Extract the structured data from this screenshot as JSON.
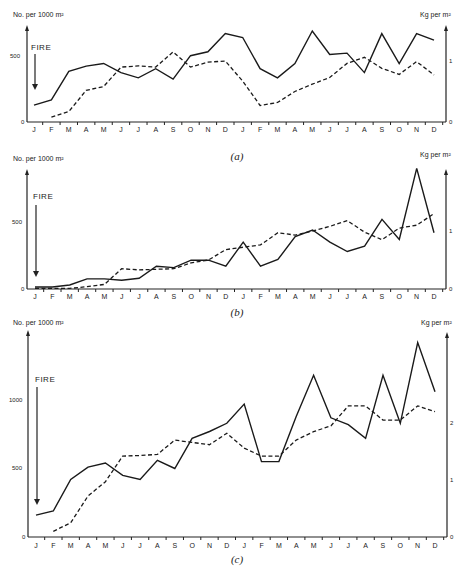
{
  "chart_data": [
    {
      "type": "line",
      "caption": "(a)",
      "title": "",
      "annotation": "FIRE",
      "ylabel_left": "No. per 1000 m²",
      "ylabel_right": "Kg per m²",
      "x": [
        "J",
        "F",
        "M",
        "A",
        "M",
        "J",
        "J",
        "A",
        "S",
        "O",
        "N",
        "D",
        "J",
        "F",
        "M",
        "A",
        "M",
        "J",
        "J",
        "A",
        "S",
        "O",
        "N",
        "D"
      ],
      "left_ticks": [
        "0",
        "500"
      ],
      "right_ticks": [
        "0",
        "1"
      ],
      "ylim_left": [
        0,
        800
      ],
      "ylim_right": [
        0,
        1.3
      ],
      "series": [
        {
          "name": "No. per 1000 m² (solid)",
          "axis": "left",
          "style": "solid",
          "values": [
            130,
            170,
            390,
            430,
            450,
            380,
            340,
            410,
            330,
            510,
            540,
            680,
            650,
            410,
            340,
            450,
            700,
            520,
            530,
            380,
            680,
            450,
            680,
            630
          ]
        },
        {
          "name": "Kg per m² (dashed)",
          "axis": "right",
          "style": "dashed",
          "values": [
            null,
            0.08,
            0.17,
            0.52,
            0.58,
            0.9,
            0.92,
            0.9,
            1.15,
            0.9,
            0.98,
            1.0,
            0.67,
            0.27,
            0.32,
            0.5,
            0.62,
            0.73,
            0.96,
            1.06,
            0.88,
            0.78,
            0.99,
            0.77
          ]
        }
      ]
    },
    {
      "type": "line",
      "caption": "(b)",
      "title": "",
      "annotation": "FIRE",
      "ylabel_left": "No. per 1000 m²",
      "ylabel_right": "Kg per m²",
      "x": [
        "J",
        "F",
        "M",
        "A",
        "M",
        "J",
        "J",
        "A",
        "S",
        "O",
        "N",
        "D",
        "J",
        "F",
        "M",
        "A",
        "M",
        "J",
        "J",
        "A",
        "S",
        "O",
        "N",
        "D"
      ],
      "left_ticks": [
        "0",
        "500"
      ],
      "right_ticks": [
        "0",
        "1"
      ],
      "ylim_left": [
        0,
        900
      ],
      "ylim_right": [
        0,
        1.6
      ],
      "series": [
        {
          "name": "No. per 1000 m² (solid)",
          "axis": "left",
          "style": "solid",
          "values": [
            15,
            15,
            30,
            75,
            75,
            65,
            80,
            170,
            160,
            215,
            215,
            170,
            350,
            170,
            220,
            390,
            440,
            350,
            280,
            320,
            520,
            370,
            900,
            420
          ]
        },
        {
          "name": "Kg per m² (dashed)",
          "axis": "right",
          "style": "dashed",
          "values": [
            0.01,
            0.01,
            0.01,
            0.04,
            0.08,
            0.35,
            0.33,
            0.34,
            0.35,
            0.45,
            0.5,
            0.68,
            0.72,
            0.76,
            0.97,
            0.93,
            1.0,
            1.08,
            1.18,
            0.98,
            0.85,
            1.05,
            1.1,
            1.3
          ]
        }
      ]
    },
    {
      "type": "line",
      "caption": "(c)",
      "title": "",
      "annotation": "FIRE",
      "ylabel_left": "No. per 1000 m²",
      "ylabel_right": "Kg per m²",
      "x": [
        "J",
        "F",
        "M",
        "A",
        "M",
        "J",
        "J",
        "A",
        "S",
        "O",
        "N",
        "D",
        "J",
        "F",
        "M",
        "A",
        "M",
        "J",
        "J",
        "A",
        "S",
        "O",
        "N",
        "D"
      ],
      "left_ticks": [
        "0",
        "500",
        "1000"
      ],
      "right_ticks": [
        "0",
        "1",
        "2"
      ],
      "ylim_left": [
        0,
        1500
      ],
      "ylim_right": [
        0,
        3
      ],
      "series": [
        {
          "name": "No. per 1000 m² (solid)",
          "axis": "left",
          "style": "solid",
          "values": [
            160,
            190,
            420,
            510,
            540,
            450,
            420,
            560,
            500,
            720,
            770,
            830,
            970,
            550,
            550,
            880,
            1180,
            870,
            820,
            720,
            1180,
            830,
            1420,
            1060
          ]
        },
        {
          "name": "Kg per m² (dashed)",
          "axis": "right",
          "style": "dashed",
          "values": [
            null,
            0.1,
            0.25,
            0.72,
            0.97,
            1.42,
            1.43,
            1.45,
            1.7,
            1.66,
            1.62,
            1.82,
            1.56,
            1.42,
            1.42,
            1.7,
            1.85,
            1.95,
            2.3,
            2.3,
            2.05,
            2.05,
            2.3,
            2.2
          ]
        }
      ]
    }
  ],
  "charts": [
    {
      "caption": "(a)",
      "ylabel_left": "No. per 1000 m²",
      "ylabel_right": "Kg per m²",
      "annotation": "FIRE",
      "tick_left_1": "500",
      "tick_left_0": "0",
      "tick_right_1": "1",
      "tick_right_0": "0"
    },
    {
      "caption": "(b)",
      "ylabel_left": "No. per 1000 m²",
      "ylabel_right": "Kg per m²",
      "annotation": "FIRE",
      "tick_left_1": "500",
      "tick_left_0": "0",
      "tick_right_1": "1",
      "tick_right_0": "0"
    },
    {
      "caption": "(c)",
      "ylabel_left": "No. per 1000 m²",
      "ylabel_right": "Kg per m²",
      "annotation": "FIRE",
      "tick_left_2": "1000",
      "tick_left_1": "500",
      "tick_left_0": "0",
      "tick_right_2": "2",
      "tick_right_1": "1",
      "tick_right_0": "0"
    }
  ],
  "months": [
    "J",
    "F",
    "M",
    "A",
    "M",
    "J",
    "J",
    "A",
    "S",
    "O",
    "N",
    "D",
    "J",
    "F",
    "M",
    "A",
    "M",
    "J",
    "J",
    "A",
    "S",
    "O",
    "N",
    "D"
  ]
}
